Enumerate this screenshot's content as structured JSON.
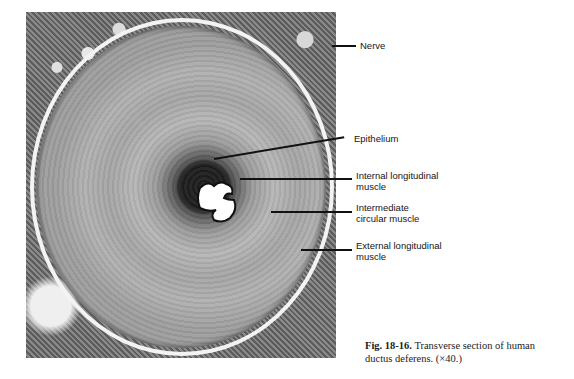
{
  "figure": {
    "image_alt": "Light micrograph of transverse section of human ductus deferens",
    "labels": [
      {
        "id": "nerve",
        "text": "Nerve"
      },
      {
        "id": "epithelium",
        "text": "Epithelium"
      },
      {
        "id": "internal",
        "line1": "Internal longitudinal",
        "line2": "muscle"
      },
      {
        "id": "intermediate",
        "line1": "Intermediate",
        "line2": "circular muscle"
      },
      {
        "id": "external",
        "line1": "External longitudinal",
        "line2": "muscle"
      }
    ]
  },
  "caption": {
    "number": "Fig. 18-16.",
    "text": "Transverse section of human ductus deferens. (×40.)"
  }
}
